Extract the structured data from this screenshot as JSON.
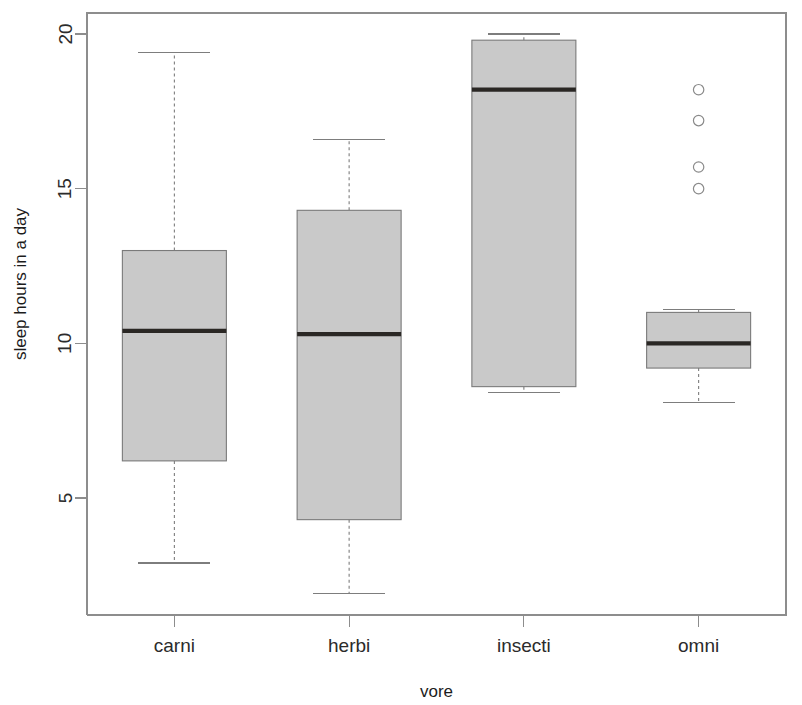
{
  "chart_data": {
    "type": "box",
    "title": "",
    "xlabel": "vore",
    "ylabel": "sleep hours in a day",
    "categories": [
      "carni",
      "herbi",
      "insecti",
      "omni"
    ],
    "ylim": [
      1.5,
      20.5
    ],
    "y_ticks": [
      5,
      10,
      15,
      20
    ],
    "y_tick_labels": [
      "5",
      "10",
      "15",
      "20"
    ],
    "grid": false,
    "legend": "none",
    "box_fill_color": "#c9c9c9",
    "box_border_color": "#7a7a7a",
    "median_color": "#2a2724",
    "whisker_color": "#7d7d7d",
    "axis_color": "#8d8d8d",
    "boxes": [
      {
        "name": "carni",
        "whisker_low": 2.9,
        "q1": 6.2,
        "median": 10.4,
        "q3": 13.0,
        "whisker_high": 19.4,
        "outliers": []
      },
      {
        "name": "herbi",
        "whisker_low": 1.9,
        "q1": 4.3,
        "median": 10.3,
        "q3": 14.3,
        "whisker_high": 16.6,
        "outliers": []
      },
      {
        "name": "insecti",
        "whisker_low": 8.4,
        "q1": 8.6,
        "median": 18.2,
        "q3": 19.8,
        "whisker_high": 20.0,
        "outliers": []
      },
      {
        "name": "omni",
        "whisker_low": 8.1,
        "q1": 9.2,
        "median": 10.0,
        "q3": 11.0,
        "whisker_high": 11.1,
        "outliers": [
          18.2,
          17.2,
          15.7,
          15.0
        ]
      }
    ]
  }
}
